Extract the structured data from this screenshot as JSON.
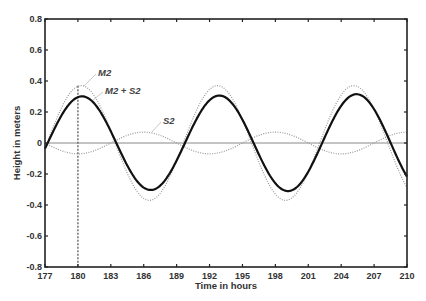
{
  "chart_data": {
    "type": "line",
    "title": "",
    "xlabel": "Time in hours",
    "ylabel": "Height in meters",
    "xlim": [
      177,
      210
    ],
    "ylim": [
      -0.8,
      0.8
    ],
    "x_ticks": [
      177,
      180,
      183,
      186,
      189,
      192,
      195,
      198,
      201,
      204,
      207,
      210
    ],
    "y_ticks": [
      -0.8,
      -0.6,
      -0.4,
      -0.2,
      0,
      0.2,
      0.4,
      0.6,
      0.8
    ],
    "y_tick_labels": [
      "-0.8",
      "-0.6",
      "-0.4",
      "-0.2",
      "0",
      "0.2",
      "0.4",
      "0.6",
      "0.8"
    ],
    "grid": false,
    "legend": "inline annotations",
    "series": [
      {
        "name": "M2",
        "style": "dotted",
        "color": "#9a9a9a",
        "model": {
          "amplitude": 0.37,
          "period_h": 12.42,
          "peak_at_h": 180.3
        },
        "key_points": [
          [
            180.3,
            0.37
          ],
          [
            186.5,
            -0.37
          ],
          [
            192.7,
            0.37
          ],
          [
            198.9,
            -0.37
          ],
          [
            205.1,
            0.37
          ],
          [
            210,
            -0.29
          ]
        ]
      },
      {
        "name": "S2",
        "style": "dotted",
        "color": "#9a9a9a",
        "model": {
          "amplitude": 0.07,
          "period_h": 12.0,
          "peak_at_h": 186.0
        },
        "key_points": [
          [
            180,
            -0.07
          ],
          [
            186,
            0.07
          ],
          [
            192,
            -0.07
          ],
          [
            198,
            0.07
          ],
          [
            204,
            -0.07
          ],
          [
            210,
            0.07
          ]
        ]
      },
      {
        "name": "M2 + S2",
        "style": "solid",
        "color": "#111111",
        "model": {
          "sum_of": [
            "M2",
            "S2"
          ]
        },
        "key_points": [
          [
            180.3,
            0.3
          ],
          [
            183.2,
            0.0
          ],
          [
            186.3,
            -0.3
          ],
          [
            189.3,
            0.0
          ],
          [
            192.6,
            0.3
          ],
          [
            195.9,
            0.0
          ],
          [
            198.9,
            -0.3
          ],
          [
            201.8,
            0.0
          ],
          [
            205.0,
            0.3
          ],
          [
            208.0,
            0.0
          ],
          [
            210,
            -0.24
          ]
        ]
      }
    ],
    "annotations": [
      {
        "text": "M2",
        "x_px": 98,
        "y_px": 76,
        "leader_to": [
          84,
          86
        ]
      },
      {
        "text": "M2 + S2",
        "x_px": 105,
        "y_px": 94,
        "leader_to": [
          93,
          100
        ]
      },
      {
        "text": "S2",
        "x_px": 163,
        "y_px": 124,
        "leader_to": [
          152,
          132
        ]
      }
    ],
    "reference_lines": [
      {
        "type": "horizontal",
        "y": 0,
        "color": "#888888"
      },
      {
        "type": "vertical-dashed",
        "x": 180,
        "from_y": 0.37,
        "to_y": -0.8,
        "color": "#666666"
      }
    ]
  }
}
